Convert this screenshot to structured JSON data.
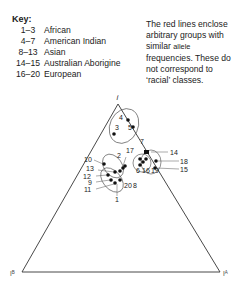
{
  "key": {
    "title": "Key:",
    "rows": [
      {
        "range": "1–3",
        "label": "African"
      },
      {
        "range": "4–7",
        "label": "American Indian"
      },
      {
        "range": "8–13",
        "label": "Asian"
      },
      {
        "range": "14–15",
        "label": "Australian Aborigine"
      },
      {
        "range": "16–20",
        "label": "European"
      }
    ]
  },
  "note": {
    "part1": "The red lines enclose arbitrary groups with similar ",
    "allele": "allele",
    "part2": " frequencies. These do not correspond to ‘racial’ classes."
  },
  "diagram": {
    "vertex_top": "i",
    "vertex_left": "IB",
    "vertex_right": "IA",
    "points": [
      {
        "id": "1",
        "x": 117,
        "y": 180
      },
      {
        "id": "2",
        "x": 124,
        "y": 160
      },
      {
        "id": "3",
        "x": 114,
        "y": 134
      },
      {
        "id": "4",
        "x": 128,
        "y": 120
      },
      {
        "id": "5",
        "x": 133,
        "y": 127
      },
      {
        "id": "6",
        "x": 140,
        "y": 163
      },
      {
        "id": "7",
        "x": 146,
        "y": 150
      },
      {
        "id": "8",
        "x": 124,
        "y": 165
      },
      {
        "id": "9",
        "x": 111,
        "y": 181
      },
      {
        "id": "10",
        "x": 104,
        "y": 164
      },
      {
        "id": "11",
        "x": 114,
        "y": 185
      },
      {
        "id": "12",
        "x": 108,
        "y": 175
      },
      {
        "id": "13",
        "x": 115,
        "y": 172
      },
      {
        "id": "14",
        "x": 147,
        "y": 154
      },
      {
        "id": "15",
        "x": 157,
        "y": 171
      },
      {
        "id": "16",
        "x": 145,
        "y": 161
      },
      {
        "id": "17",
        "x": 141,
        "y": 160
      },
      {
        "id": "18",
        "x": 157,
        "y": 162
      },
      {
        "id": "19",
        "x": 146,
        "y": 166
      },
      {
        "id": "20",
        "x": 120,
        "y": 168
      }
    ]
  }
}
